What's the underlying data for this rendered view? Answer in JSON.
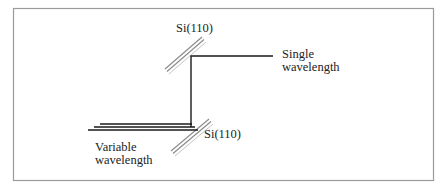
{
  "diagram": {
    "type": "double-crystal monochromator schematic",
    "colors": {
      "frame": "#9a9a9a",
      "beam": "#1a1a1a",
      "crystal": "#8a8a8a",
      "text": "#222222"
    },
    "labels": {
      "top_crystal": "Si(110)",
      "bottom_crystal": "Si(110)",
      "output_line1": "Single",
      "output_line2": "wavelength",
      "input_line1": "Variable",
      "input_line2": "wavelength"
    },
    "elements": {
      "frame": {
        "x": 13,
        "y": 8,
        "w": 420,
        "h": 172
      },
      "top_crystal": {
        "x1": 166,
        "y1": 70,
        "x2": 203,
        "y2": 38
      },
      "bottom_crystal": {
        "x1": 172,
        "y1": 152,
        "x2": 210,
        "y2": 120
      },
      "output_beam_vertical": {
        "x": 191,
        "y1": 56,
        "y2": 127
      },
      "output_beam_horizontal": {
        "y": 56,
        "x1": 191,
        "x2": 273
      },
      "input_beams": [
        {
          "y": 124,
          "x1": 100,
          "x2": 192
        },
        {
          "y": 127,
          "x1": 94,
          "x2": 195
        },
        {
          "y": 130,
          "x1": 88,
          "x2": 198
        }
      ]
    }
  }
}
